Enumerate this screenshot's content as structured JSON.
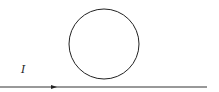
{
  "diagram": {
    "wire": {
      "label": "I",
      "direction": "right",
      "x1": 0,
      "x2": 207,
      "y": 87
    },
    "loop": {
      "cx": 104,
      "cy": 44,
      "r": 35
    },
    "arrow": {
      "x": 55,
      "y": 87
    },
    "colors": {
      "stroke": "#222222",
      "background": "#ffffff"
    }
  }
}
